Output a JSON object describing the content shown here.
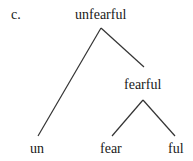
{
  "label": "c.",
  "tree": {
    "root": "unfearful",
    "inner": "fearful",
    "leaves": [
      "un",
      "fear",
      "ful"
    ]
  },
  "colors": {
    "ink": "#1a1a1a",
    "background": "#ffffff"
  }
}
